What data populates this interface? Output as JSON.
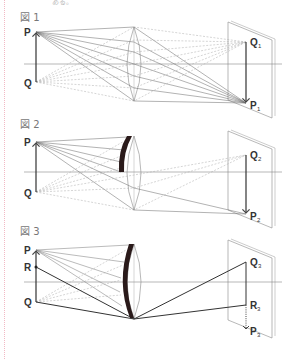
{
  "top_text": "ある。",
  "figures": [
    {
      "label": "図 1",
      "points": {
        "P": "P",
        "Q": "Q",
        "image_top": "Q",
        "image_top_sub": "1",
        "image_bottom": "P",
        "image_bottom_sub": "1"
      }
    },
    {
      "label": "図 2",
      "points": {
        "P": "P",
        "Q": "Q",
        "image_top": "Q",
        "image_top_sub": "2",
        "image_bottom": "P",
        "image_bottom_sub": "2"
      }
    },
    {
      "label": "図 3",
      "points": {
        "P": "P",
        "R": "R",
        "Q": "Q",
        "image_top": "Q",
        "image_top_sub": "3",
        "image_mid": "R",
        "image_mid_sub": "3",
        "image_bottom": "P",
        "image_bottom_sub": "3"
      }
    }
  ],
  "colors": {
    "line": "#555555",
    "dashed": "#aaaaaa",
    "stop": "#2a1a1a",
    "margin": "#f2b9c4"
  }
}
